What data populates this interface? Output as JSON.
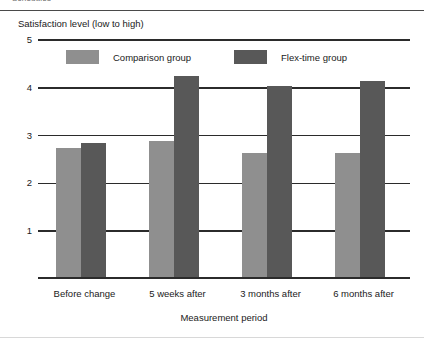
{
  "page": {
    "running_head": "Schedules"
  },
  "chart_data": {
    "type": "bar",
    "title": "",
    "ylabel": "Satisfaction level  (low to high)",
    "xlabel": "Measurement period",
    "categories": [
      "Before change",
      "5 weeks after",
      "3 months after",
      "6 months after"
    ],
    "series": [
      {
        "name": "Comparison group",
        "color": "#8f8f8f",
        "values": [
          2.7,
          2.85,
          2.6,
          2.6
        ]
      },
      {
        "name": "Flex-time group",
        "color": "#585858",
        "values": [
          2.8,
          4.2,
          4.0,
          4.1
        ]
      }
    ],
    "ylim": [
      0,
      5
    ],
    "yticks": [
      "1",
      "2",
      "3",
      "4",
      "5"
    ],
    "ytick_values": [
      1,
      2,
      3,
      4,
      5
    ],
    "grid": true,
    "legend_position": "top-inside"
  },
  "legend": {
    "items": [
      {
        "label": "Comparison group",
        "color": "#8f8f8f"
      },
      {
        "label": "Flex-time group",
        "color": "#585858"
      }
    ]
  }
}
